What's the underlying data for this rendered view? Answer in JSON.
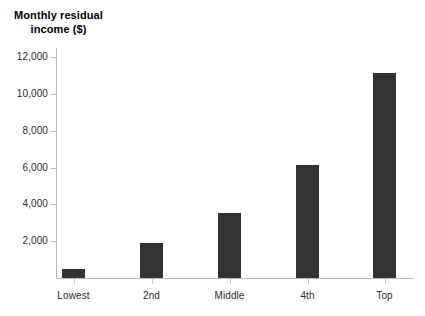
{
  "chart_data": {
    "type": "bar",
    "title": "Monthly residual income ($)",
    "title_lines": [
      "Monthly residual",
      "income ($)"
    ],
    "xlabel": "",
    "ylabel": "Monthly residual income ($)",
    "categories": [
      "Lowest",
      "2nd",
      "Middle",
      "4th",
      "Top"
    ],
    "values": [
      480,
      1900,
      3530,
      6140,
      11140
    ],
    "series": [
      {
        "name": "Monthly residual income",
        "values": [
          480,
          1900,
          3530,
          6140,
          11140
        ]
      }
    ],
    "ytick_labels": [
      "2,000",
      "4,000",
      "6,000",
      "8,000",
      "10,000",
      "12,000"
    ],
    "ytick_values": [
      2000,
      4000,
      6000,
      8000,
      10000,
      12000
    ],
    "ylim": [
      0,
      12800
    ],
    "grid": false,
    "legend": false,
    "bar_color": "#333333",
    "axis_color": "#b9b9b9",
    "text_color": "#2b2b2b"
  }
}
